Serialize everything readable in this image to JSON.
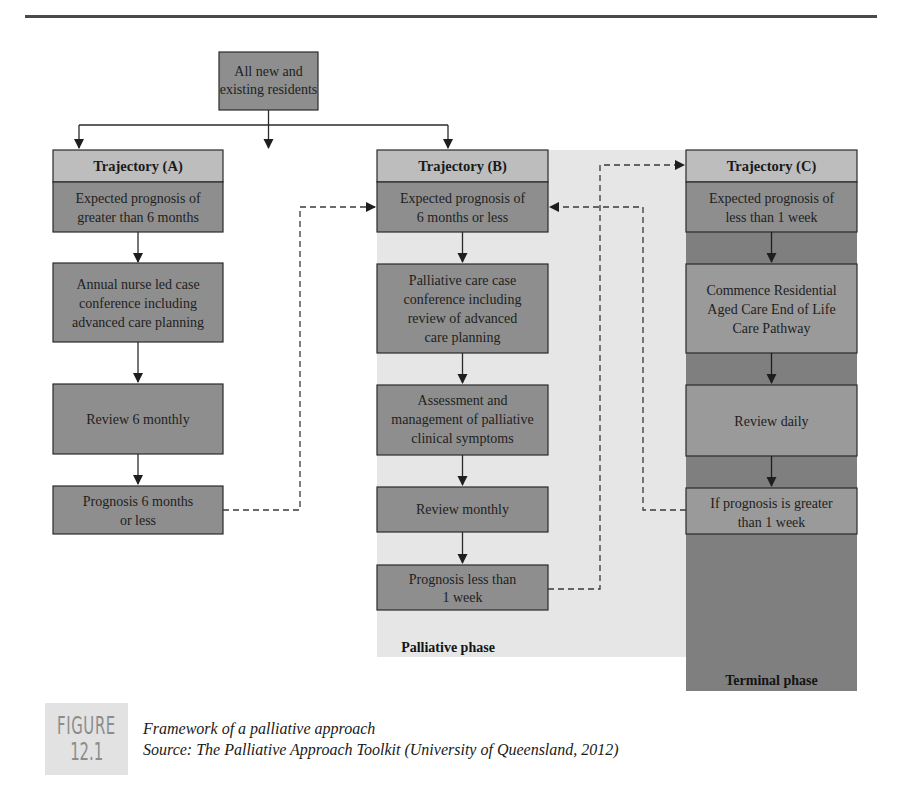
{
  "figure": {
    "badge_word": "FIGURE",
    "badge_number": "12.1",
    "title": "Framework of a palliative approach",
    "source": "Source: The Palliative Approach Toolkit (University of Queensland, 2012)"
  },
  "root": {
    "lines": [
      "All new and",
      "existing residents"
    ]
  },
  "trajectories": [
    {
      "title": "Trajectory (A)",
      "nodes": [
        {
          "lines": [
            "Expected prognosis of",
            "greater than 6 months"
          ]
        },
        {
          "lines": [
            "Annual nurse led case",
            "conference including",
            "advanced care planning"
          ]
        },
        {
          "lines": [
            "Review 6 monthly"
          ]
        },
        {
          "lines": [
            "Prognosis 6 months",
            "or less"
          ]
        }
      ]
    },
    {
      "title": "Trajectory (B)",
      "nodes": [
        {
          "lines": [
            "Expected prognosis of",
            "6 months or less"
          ]
        },
        {
          "lines": [
            "Palliative care case",
            "conference including",
            "review of advanced",
            "care planning"
          ]
        },
        {
          "lines": [
            "Assessment and",
            "management of palliative",
            "clinical symptoms"
          ]
        },
        {
          "lines": [
            "Review monthly"
          ]
        },
        {
          "lines": [
            "Prognosis less than",
            "1 week"
          ]
        }
      ]
    },
    {
      "title": "Trajectory (C)",
      "nodes": [
        {
          "lines": [
            "Expected prognosis of",
            "less than 1 week"
          ]
        },
        {
          "lines": [
            "Commence Residential",
            "Aged Care End of Life",
            "Care Pathway"
          ]
        },
        {
          "lines": [
            "Review daily"
          ]
        },
        {
          "lines": [
            "If prognosis is greater",
            "than 1 week"
          ]
        }
      ]
    }
  ],
  "phases": {
    "palliative": "Palliative phase",
    "terminal": "Terminal phase"
  },
  "colors": {
    "node_fill": "#8e8e8e",
    "title_fill": "#bdbdbd",
    "palliative_bg": "#e6e6e6",
    "terminal_bg": "#7f7f7f",
    "terminal_node_fill": "#9a9a9a",
    "line": "#2a2a2a",
    "badge_bg": "#e2e2e2"
  }
}
